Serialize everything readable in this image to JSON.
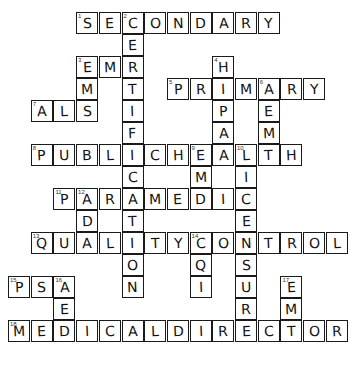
{
  "puzzle": {
    "cell_size": 22.7,
    "rows": 15,
    "cols": 15,
    "entries": [
      {
        "number": 1,
        "direction": "across",
        "row": 0,
        "col": 3,
        "answer": "SECONDARY"
      },
      {
        "number": 2,
        "direction": "down",
        "row": 0,
        "col": 5,
        "answer": "CERTIFICATION"
      },
      {
        "number": 3,
        "direction": "across",
        "row": 2,
        "col": 3,
        "answer": "EMR"
      },
      {
        "number": 3,
        "direction": "down",
        "row": 2,
        "col": 3,
        "answer": "EMS"
      },
      {
        "number": 4,
        "direction": "down",
        "row": 2,
        "col": 9,
        "answer": "HIPAA"
      },
      {
        "number": 5,
        "direction": "across",
        "row": 3,
        "col": 7,
        "answer": "PRIMARY"
      },
      {
        "number": 6,
        "direction": "down",
        "row": 3,
        "col": 11,
        "answer": "AEMT"
      },
      {
        "number": 7,
        "direction": "across",
        "row": 4,
        "col": 1,
        "answer": "ALS"
      },
      {
        "number": 8,
        "direction": "across",
        "row": 6,
        "col": 1,
        "answer": "PUBLICHEALTH"
      },
      {
        "number": 9,
        "direction": "down",
        "row": 6,
        "col": 8,
        "answer": "EMD"
      },
      {
        "number": 10,
        "direction": "down",
        "row": 6,
        "col": 10,
        "answer": "LICENSURE"
      },
      {
        "number": 11,
        "direction": "across",
        "row": 8,
        "col": 2,
        "answer": "PARAMEDIC"
      },
      {
        "number": 12,
        "direction": "down",
        "row": 8,
        "col": 3,
        "answer": "ADA"
      },
      {
        "number": 13,
        "direction": "across",
        "row": 10,
        "col": 1,
        "answer": "QUALITYCONTROL"
      },
      {
        "number": 14,
        "direction": "down",
        "row": 10,
        "col": 8,
        "answer": "CQI"
      },
      {
        "number": 15,
        "direction": "across",
        "row": 12,
        "col": 0,
        "answer": "PSA"
      },
      {
        "number": 16,
        "direction": "down",
        "row": 12,
        "col": 2,
        "answer": "AED"
      },
      {
        "number": 17,
        "direction": "down",
        "row": 12,
        "col": 12,
        "answer": "EMT"
      },
      {
        "number": 18,
        "direction": "across",
        "row": 14,
        "col": 0,
        "answer": "MEDICALDIRECTOR"
      }
    ]
  }
}
